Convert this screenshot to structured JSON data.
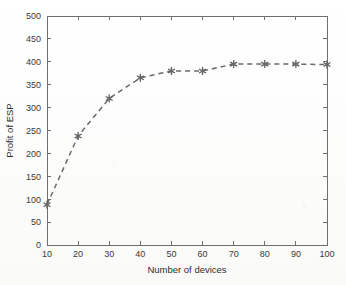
{
  "chart_data": {
    "type": "line",
    "title": "",
    "xlabel": "Number of devices",
    "ylabel": "Profit of ESP",
    "x": [
      10,
      20,
      30,
      40,
      50,
      60,
      70,
      80,
      90,
      100
    ],
    "values": [
      88,
      238,
      320,
      365,
      380,
      380,
      395,
      395,
      395,
      394
    ],
    "series": [
      {
        "name": "Profit of ESP",
        "values": [
          88,
          238,
          320,
          365,
          380,
          380,
          395,
          395,
          395,
          394
        ]
      }
    ],
    "xlim": [
      10,
      100
    ],
    "ylim": [
      0,
      500
    ],
    "xticks": [
      10,
      20,
      30,
      40,
      50,
      60,
      70,
      80,
      90,
      100
    ],
    "yticks": [
      0,
      50,
      100,
      150,
      200,
      250,
      300,
      350,
      400,
      450,
      500
    ],
    "xtick_labels": [
      "10",
      "20",
      "30",
      "40",
      "50",
      "60",
      "70",
      "80",
      "90",
      "100"
    ],
    "ytick_labels": [
      "0",
      "50",
      "100",
      "150",
      "200",
      "250",
      "300",
      "350",
      "400",
      "450",
      "500"
    ],
    "grid": false,
    "legend": null,
    "legend_position": "none",
    "line_style": "dashed",
    "marker_style": "star",
    "line_color": "#6a6a6a",
    "marker_color": "#5a5a5a",
    "axis_color": "#6f6f6f",
    "background_color": "#ffffff"
  }
}
